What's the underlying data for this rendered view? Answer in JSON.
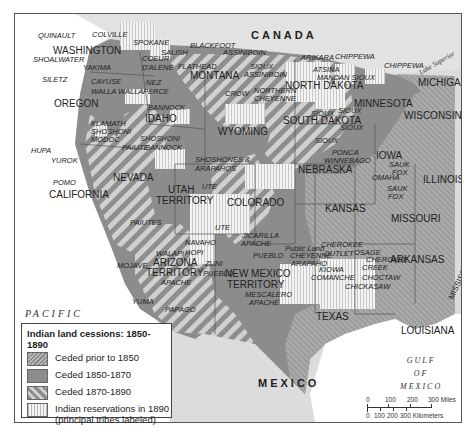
{
  "map": {
    "countries": [
      "CANADA",
      "MEXICO"
    ],
    "oceans": [
      {
        "line1": "PACIFIC",
        "line2": "OCEAN"
      },
      {
        "line1": "GULF",
        "line2": "OF",
        "line3": "MEXICO"
      }
    ],
    "lakes": [
      "Lake Superior",
      "Lake Michigan"
    ],
    "states": [
      "WASHINGTON",
      "OREGON",
      "CALIFORNIA",
      "NEVADA",
      "IDAHO",
      "MONTANA",
      "WYOMING",
      "UTAH",
      "TERRITORY",
      "COLORADO",
      "ARIZONA",
      "TERRITORY",
      "NEW MEXICO",
      "TERRITORY",
      "NORTH DAKOTA",
      "SOUTH DAKOTA",
      "NEBRASKA",
      "KANSAS",
      "TEXAS",
      "MINNESOTA",
      "IOWA",
      "MISSOURI",
      "ARKANSAS",
      "LOUISIANA",
      "WISCONSIN",
      "ILLINOIS",
      "MICHIGAN",
      "MISSISSIPPI"
    ],
    "other_labels": [
      "Public Land"
    ],
    "tribes": [
      "QUINAULT",
      "COLVILLE",
      "SPOKANE",
      "SHOALWATER",
      "YAKIMA",
      "SILETZ",
      "CAYUSE",
      "WALLA WALLA",
      "COEUR",
      "D'ALENE",
      "NEZ",
      "PERCE",
      "SALISH",
      "FLATHEAD",
      "BLACKFOOT",
      "ASSINIBOIN",
      "SIOUX",
      "ASSINIBOIN",
      "CROW",
      "NORTHERN",
      "CHEYENNE",
      "ARIKARA",
      "CHIPPEWA",
      "ATSINA",
      "MANDAN SIOUX",
      "CHIPPEWA",
      "SIOUX",
      "SIOUX",
      "SIOUX",
      "SIOUX",
      "PONCA",
      "WINNEBAGO",
      "OMAHA",
      "SAUK",
      "FOX",
      "SAUK",
      "FOX",
      "BANNOCK",
      "KLAMATH",
      "SHOSHONI",
      "MODOC",
      "PAIUTE",
      "SHOSHONI",
      "BANNOCK",
      "HUPA",
      "YUROK",
      "POMO",
      "SHOSHONES &",
      "ARAPAHOS",
      "UTE",
      "PAIUTES",
      "UTE",
      "JICARILLA",
      "APACHE",
      "NAVAHO",
      "HOPI",
      "WALAPI",
      "ZUNI",
      "PUEBLO",
      "PUEBLO",
      "MOJAVE",
      "APACHE",
      "YUMA",
      "PAPAGO",
      "MESCALERO",
      "APACHE",
      "CHEYENNE",
      "ARAPAHO",
      "KIOWA",
      "COMANCHE",
      "CHEROKEE",
      "OUTLET",
      "OSAGE",
      "CHEROKEE",
      "CREEK",
      "CHOCTAW",
      "CHICKASAW"
    ]
  },
  "legend": {
    "title": "Indian land cessions:  1850-1890",
    "items": [
      {
        "label": "Ceded prior to 1850",
        "pattern": "fine-diagonal"
      },
      {
        "label": "Ceded 1850-1870",
        "pattern": "solid-gray"
      },
      {
        "label": "Ceded 1870-1890",
        "pattern": "wide-diagonal"
      },
      {
        "label": "Indian reservations in 1890",
        "label2": "(principal tribes labeled)",
        "pattern": "vertical-stripes"
      }
    ]
  },
  "scale": {
    "miles": [
      "0",
      "100",
      "200",
      "300 Miles"
    ],
    "km": [
      "0",
      "100",
      "200",
      "300 Kilometers"
    ]
  },
  "colors": {
    "land": "#8c8c8c",
    "outside": "#dadada",
    "water": "#ffffff",
    "hatch": "#c8c8c8"
  }
}
